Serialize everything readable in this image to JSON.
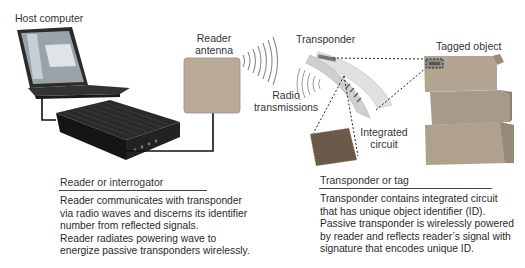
{
  "labels": {
    "host_computer": "Host computer",
    "reader_antenna_line1": "Reader",
    "reader_antenna_line2": "antenna",
    "transponder": "Transponder",
    "tagged_object": "Tagged object",
    "radio_line1": "Radio",
    "radio_line2": "transmissions",
    "ic_line1": "Integrated",
    "ic_line2": "circuit"
  },
  "reader_section": {
    "title": "Reader or interrogator",
    "lines": [
      "Reader communicates with transponder",
      "via radio waves and discerns its identifier",
      "number from reflected signals.",
      "Reader radiates powering wave to",
      "energize passive transponders wirelessly."
    ]
  },
  "tag_section": {
    "title": "Transponder or tag",
    "lines": [
      "Transponder contains integrated circuit",
      "that has unique object identifier (ID).",
      "Passive transponder is wirelessly powered",
      "by reader and reflects reader’s signal with",
      "signature that encodes unique ID."
    ]
  },
  "colors": {
    "text": "#333333",
    "laptop": "#2b2b2b",
    "reader_device": "#1f1f1f",
    "antenna_panel": "#b9aa98",
    "box": "#a89a88",
    "waves": "#8a8a8a",
    "tag_film": "#d9d9d9",
    "chip": "#6b5a4a"
  }
}
